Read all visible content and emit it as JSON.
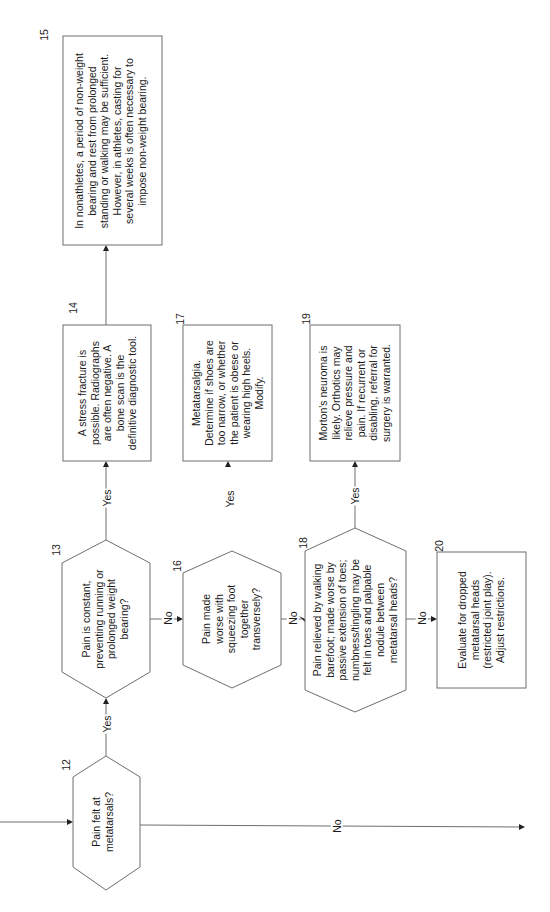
{
  "diagram": {
    "orientation": "rotated-90-ccw",
    "nodes": [
      {
        "id": "12",
        "type": "decision",
        "text": "Pain felt at\nmetatarsals?"
      },
      {
        "id": "13",
        "type": "decision",
        "text": "Pain is constant,\npreventing running or\nprolonged weight\nbearing?"
      },
      {
        "id": "14",
        "type": "process",
        "text": "A stress fracture is\npossible. Radiographs\nare often negative. A\nbone scan is the\ndefinitive diagnostic tool."
      },
      {
        "id": "15",
        "type": "process",
        "text": "In nonathletes, a period of non-weight\nbearing and rest from prolonged\nstanding or walking may be sufficient.\nHowever, in athletes, casting for\nseveral weeks is often necessary to\nimpose non-weight bearing."
      },
      {
        "id": "16",
        "type": "decision",
        "text": "Pain made\nworse with\nsqueezing foot\ntogether\ntransversely?"
      },
      {
        "id": "17",
        "type": "process",
        "text": "Metatarsalgia.\nDetermine if shoes are\ntoo narrow, or whether\nthe patient is obese or\nwearing high heels.\nModify."
      },
      {
        "id": "18",
        "type": "decision",
        "text": "Pain relieved by walking\nbarefoot; made worse by\npassive extension of toes;\nnumbness/tingling may be\nfelt in toes and palpable\nnodule between\nmetatarsal heads?"
      },
      {
        "id": "19",
        "type": "process",
        "text": "Morton's neuroma is\nlikely. Orthotics may\nrelieve pressure and\npain.  If recurrent or\ndisabling, referral for\nsurgery is warranted."
      },
      {
        "id": "20",
        "type": "process",
        "text": "Evaluate for dropped\nmetatarsal heads\n(restricted joint play).\nAdjust restrictions."
      }
    ],
    "edges": [
      {
        "from": "12",
        "to": "13",
        "label": "Yes"
      },
      {
        "from": "12",
        "to": "off-page",
        "label": "No"
      },
      {
        "from": "13",
        "to": "14",
        "label": "Yes"
      },
      {
        "from": "13",
        "to": "16",
        "label": "No"
      },
      {
        "from": "14",
        "to": "15",
        "label": ""
      },
      {
        "from": "16",
        "to": "17",
        "label": "Yes"
      },
      {
        "from": "16",
        "to": "18",
        "label": "No"
      },
      {
        "from": "18",
        "to": "19",
        "label": "Yes"
      },
      {
        "from": "18",
        "to": "20",
        "label": "No"
      }
    ]
  }
}
